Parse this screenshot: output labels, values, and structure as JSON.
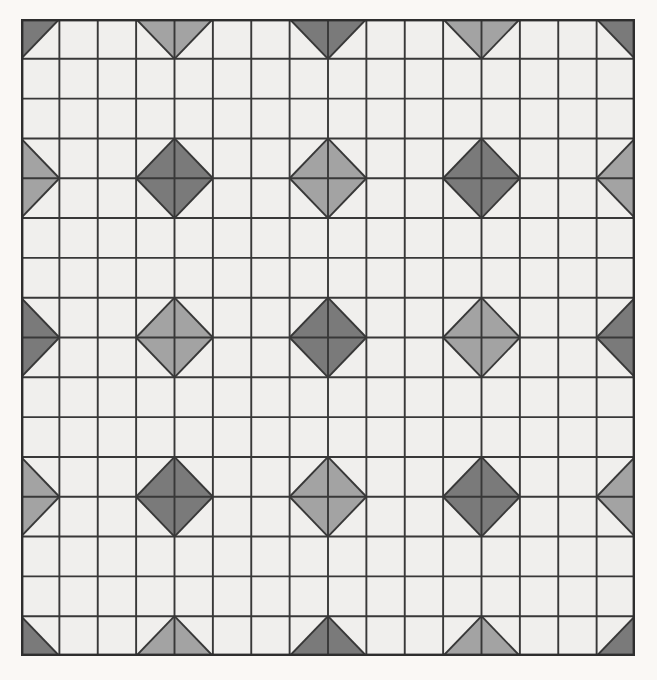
{
  "artwork": {
    "title": "Geometric Quilt Pattern",
    "description": "Sawtooth star lattice composed of half-square-triangle patches",
    "canvas": {
      "width": 657,
      "height": 680,
      "background": "#faf8f5"
    },
    "grid": {
      "columns": 16,
      "rows": 16,
      "origin_x": 21,
      "origin_y": 19,
      "cell_width": 38.375,
      "cell_height": 39.8125,
      "seam_color": "#383838",
      "seam_width": 1.9,
      "outer_border_color": "#2e2e2e",
      "outer_border_width": 2.4
    },
    "palette": {
      "light": "#f0efed",
      "medium": "#a3a3a3",
      "dark": "#7a7a7a",
      "seam": "#383838",
      "page": "#faf8f5"
    },
    "motif": {
      "name": "sawtooth-star",
      "period_cells": 4,
      "star_centers_dark": "vertices where (vx/4 + vy/4) is even",
      "star_centers_medium": "vertices where (vx/4 + vy/4) is odd"
    },
    "block_legend": [
      {
        "code": "L",
        "name": "plain-light-square",
        "fill_a": "light",
        "fill_b": "light"
      },
      {
        "code": "M",
        "name": "plain-medium-square",
        "fill_a": "medium",
        "fill_b": "medium"
      },
      {
        "code": "D",
        "name": "plain-dark-square",
        "fill_a": "dark",
        "fill_b": "dark"
      },
      {
        "code": "TL",
        "name": "hst-triangle-top-left",
        "fill_a": "shade",
        "fill_b": "light"
      },
      {
        "code": "TR",
        "name": "hst-triangle-top-right",
        "fill_a": "shade",
        "fill_b": "light"
      },
      {
        "code": "BL",
        "name": "hst-triangle-bottom-left",
        "fill_a": "shade",
        "fill_b": "light"
      },
      {
        "code": "BR",
        "name": "hst-triangle-bottom-right",
        "fill_a": "shade",
        "fill_b": "light"
      }
    ]
  },
  "chart_data": {
    "type": "heatmap",
    "xlabel": "",
    "ylabel": "",
    "grid": true,
    "legend_position": "none",
    "categories_x": [
      "c0",
      "c1",
      "c2",
      "c3",
      "c4",
      "c5",
      "c6",
      "c7",
      "c8",
      "c9",
      "c10",
      "c11",
      "c12",
      "c13",
      "c14",
      "c15"
    ],
    "categories_y": [
      "r0",
      "r1",
      "r2",
      "r3",
      "r4",
      "r5",
      "r6",
      "r7",
      "r8",
      "r9",
      "r10",
      "r11",
      "r12",
      "r13",
      "r14",
      "r15"
    ],
    "colorscale": [
      {
        "value": 0,
        "label": "light",
        "hex": "#f0efed"
      },
      {
        "value": 1,
        "label": "medium",
        "hex": "#a3a3a3"
      },
      {
        "value": 2,
        "label": "dark",
        "hex": "#7a7a7a"
      }
    ],
    "note": "Each cell is a half-square triangle unit; the value array gives the dominant shade index per cell.",
    "values": [
      [
        2,
        2,
        1,
        1,
        2,
        2,
        1,
        1,
        2,
        2,
        1,
        1,
        2,
        2,
        1,
        2
      ],
      [
        1,
        0,
        0,
        0,
        1,
        0,
        0,
        0,
        1,
        0,
        0,
        0,
        1,
        0,
        0,
        1
      ],
      [
        1,
        0,
        0,
        0,
        1,
        1,
        1,
        0,
        1,
        0,
        0,
        0,
        1,
        1,
        1,
        1
      ],
      [
        1,
        0,
        0,
        0,
        1,
        1,
        1,
        0,
        1,
        0,
        0,
        0,
        1,
        1,
        1,
        1
      ],
      [
        1,
        0,
        0,
        0,
        1,
        0,
        0,
        0,
        1,
        0,
        0,
        0,
        1,
        0,
        0,
        1
      ],
      [
        2,
        2,
        1,
        1,
        2,
        2,
        1,
        1,
        2,
        2,
        1,
        1,
        2,
        2,
        1,
        2
      ],
      [
        2,
        2,
        1,
        1,
        2,
        2,
        1,
        1,
        2,
        2,
        1,
        1,
        2,
        2,
        1,
        2
      ],
      [
        1,
        0,
        0,
        0,
        1,
        0,
        0,
        0,
        1,
        0,
        0,
        0,
        1,
        0,
        0,
        1
      ],
      [
        1,
        0,
        0,
        0,
        1,
        1,
        1,
        0,
        1,
        0,
        0,
        0,
        1,
        1,
        1,
        1
      ],
      [
        1,
        0,
        0,
        0,
        1,
        1,
        1,
        0,
        1,
        0,
        0,
        0,
        1,
        1,
        1,
        1
      ],
      [
        1,
        0,
        0,
        0,
        1,
        0,
        0,
        0,
        1,
        0,
        0,
        0,
        1,
        0,
        0,
        1
      ],
      [
        2,
        2,
        1,
        1,
        2,
        2,
        1,
        1,
        2,
        2,
        1,
        1,
        2,
        2,
        1,
        2
      ],
      [
        2,
        2,
        1,
        1,
        2,
        2,
        1,
        1,
        2,
        2,
        1,
        1,
        2,
        2,
        1,
        2
      ],
      [
        1,
        0,
        0,
        0,
        1,
        0,
        0,
        0,
        1,
        0,
        0,
        0,
        1,
        0,
        0,
        1
      ],
      [
        1,
        0,
        0,
        0,
        1,
        1,
        1,
        0,
        1,
        0,
        0,
        0,
        1,
        1,
        1,
        1
      ],
      [
        2,
        2,
        1,
        1,
        2,
        2,
        1,
        1,
        2,
        2,
        1,
        1,
        2,
        2,
        1,
        2
      ]
    ]
  }
}
